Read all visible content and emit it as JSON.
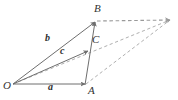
{
  "figure": {
    "kind": "vector-parallelogram-diagram",
    "width": 178,
    "height": 100,
    "background_color": "#ffffff",
    "stroke_color": "#6e6e6e",
    "dashed_color": "#9a9a9a",
    "label_color": "#333333",
    "points": {
      "O": {
        "x": 13,
        "y": 84,
        "label": "O",
        "label_x": 4,
        "label_y": 84
      },
      "A": {
        "x": 86,
        "y": 84,
        "label": "A",
        "label_x": 88,
        "label_y": 87
      },
      "B": {
        "x": 96,
        "y": 21,
        "label": "B",
        "label_x": 95,
        "label_y": 5
      },
      "C": {
        "x": 89,
        "y": 50,
        "label": "C",
        "label_x": 92,
        "label_y": 36
      },
      "D": {
        "x": 170,
        "y": 20,
        "label": "",
        "label_x": 170,
        "label_y": 20
      }
    },
    "vectors": [
      {
        "name": "a",
        "label": "a",
        "from": "O",
        "to": "A",
        "label_x": 49,
        "label_y": 84,
        "style": "solid",
        "arrow": true
      },
      {
        "name": "b",
        "label": "b",
        "from": "O",
        "to": "B",
        "label_x": 46,
        "label_y": 36,
        "style": "solid",
        "arrow": true
      },
      {
        "name": "c",
        "label": "c",
        "from": "O",
        "to": "C",
        "label_x": 61,
        "label_y": 48,
        "style": "solid",
        "arrow": true
      }
    ],
    "edges": [
      {
        "name": "edge-A-B",
        "from": "A",
        "to": "B",
        "style": "solid",
        "arrow": true
      },
      {
        "name": "edge-B-D",
        "from": "B",
        "to": "D",
        "style": "dashed",
        "arrow": true
      },
      {
        "name": "edge-O-D",
        "from": "O",
        "to": "D",
        "style": "dashed",
        "arrow": true
      },
      {
        "name": "edge-A-D",
        "from": "A",
        "to": "D",
        "style": "dashed",
        "arrow": false
      }
    ]
  }
}
